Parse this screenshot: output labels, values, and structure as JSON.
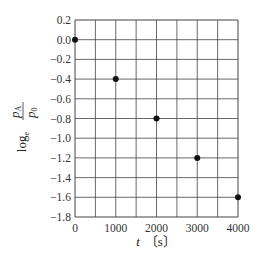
{
  "chart_data": {
    "type": "scatter",
    "title": "",
    "xlabel": "t [s]",
    "ylabel": "log_e (p_A / p_0)",
    "x": [
      0,
      1000,
      2000,
      3000,
      4000
    ],
    "y": [
      0.0,
      -0.4,
      -0.8,
      -1.2,
      -1.6
    ],
    "xlim": [
      0,
      4000
    ],
    "ylim": [
      -1.8,
      0.2
    ],
    "x_ticks": [
      "0",
      "1000",
      "2000",
      "3000",
      "4000"
    ],
    "y_ticks": [
      "0.2",
      "0.0",
      "−0.2",
      "−0.4",
      "−0.6",
      "−0.8",
      "−1.0",
      "−1.2",
      "−1.4",
      "−1.6",
      "−1.8"
    ],
    "grid": true,
    "x_grid_step": 500,
    "y_grid_step": 0.2,
    "legend": null
  },
  "labels": {
    "x_axis_var": "t",
    "x_axis_unit": "〔s〕",
    "y_axis_log": "log",
    "y_axis_log_base": "e",
    "y_axis_num": "p",
    "y_axis_num_sub": "A",
    "y_axis_den": "p",
    "y_axis_den_sub": "0"
  }
}
